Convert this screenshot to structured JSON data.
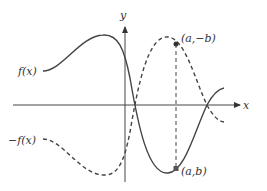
{
  "diagram": {
    "type": "function-reflection",
    "axes": {
      "x_label": "x",
      "y_label": "y"
    },
    "curves": [
      {
        "name": "f",
        "label": "f(x)",
        "style": "solid"
      },
      {
        "name": "neg_f",
        "label": "−f(x)",
        "style": "dashed"
      }
    ],
    "points": [
      {
        "label": "(a,−b)",
        "on": "neg_f"
      },
      {
        "label": "(a,b)",
        "on": "f"
      }
    ],
    "colors": {
      "stroke": "#444444",
      "text": "#333333",
      "background": "#ffffff"
    }
  }
}
